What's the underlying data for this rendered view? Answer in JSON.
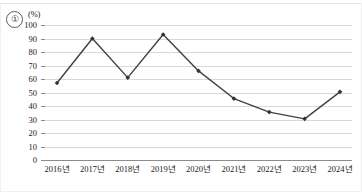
{
  "figure": {
    "item_number": "①",
    "unit_label": "(%)"
  },
  "chart_data": {
    "type": "line",
    "title": "",
    "subtitle": "",
    "xlabel": "",
    "ylabel": "(%)",
    "categories": [
      "2016년",
      "2017년",
      "2018년",
      "2019년",
      "2020년",
      "2021년",
      "2022년",
      "2023년",
      "2024년"
    ],
    "values": [
      57,
      90,
      61,
      93,
      66,
      45.5,
      35.5,
      30.5,
      50.5
    ],
    "series": [
      {
        "name": "",
        "values": [
          57,
          90,
          61,
          93,
          66,
          45.5,
          35.5,
          30.5,
          50.5
        ]
      }
    ],
    "ylim": [
      0,
      100
    ],
    "yticks": [
      0,
      10,
      20,
      30,
      40,
      50,
      60,
      70,
      80,
      90,
      100
    ],
    "ytick_labels": [
      "0",
      "10",
      "20",
      "30",
      "40",
      "50",
      "60",
      "70",
      "80",
      "90",
      "100"
    ],
    "grid": true,
    "legend": false,
    "legend_position": "none",
    "marker": "diamond",
    "line_color": "#404040",
    "marker_color": "#333333",
    "grid_color": "#d9d9d9",
    "axis_color": "#8c8c8c"
  }
}
